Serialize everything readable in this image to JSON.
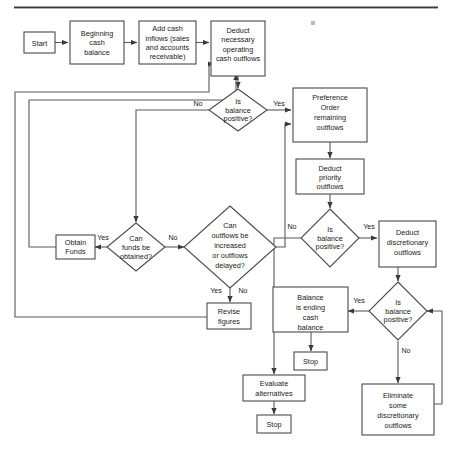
{
  "diagram": {
    "type": "flowchart",
    "colors": {
      "node_stroke": "#4a4a4a",
      "connector": "#5a5a5a",
      "text": "#1a1a1a",
      "background": "#ffffff"
    },
    "nodes": [
      {
        "id": "start",
        "shape": "rect",
        "label": "Start"
      },
      {
        "id": "beginning",
        "shape": "rect",
        "label": "Beginning cash balance"
      },
      {
        "id": "addcash",
        "shape": "rect",
        "label": "Add cash inflows (sales and accounts receivable)"
      },
      {
        "id": "deduct_nec",
        "shape": "rect",
        "label": "Deduct necessary operating cash outflows"
      },
      {
        "id": "bal1",
        "shape": "diamond",
        "label": "Is balance positive?"
      },
      {
        "id": "preference",
        "shape": "rect",
        "label": "Preference Order remaining outflows"
      },
      {
        "id": "deduct_pri",
        "shape": "rect",
        "label": "Deduct priority outflows"
      },
      {
        "id": "bal2",
        "shape": "diamond",
        "label": "Is balance positive?"
      },
      {
        "id": "deduct_disc",
        "shape": "rect",
        "label": "Deduct discretionary outflows"
      },
      {
        "id": "bal3",
        "shape": "diamond",
        "label": "Is balance positive?"
      },
      {
        "id": "canfunds",
        "shape": "diamond",
        "label": "Can funds be obtained?"
      },
      {
        "id": "obtain",
        "shape": "rect",
        "label": "Obtain Funds"
      },
      {
        "id": "canoutflows",
        "shape": "diamond",
        "label": "Can outflows be increased or outflows delayed?"
      },
      {
        "id": "revise",
        "shape": "rect",
        "label": "Revise figures"
      },
      {
        "id": "balending",
        "shape": "rect",
        "label": "Balance is ending cash balance"
      },
      {
        "id": "stop_bal",
        "shape": "rect",
        "label": "Stop"
      },
      {
        "id": "evaluate",
        "shape": "rect",
        "label": "Evaluate alternatives"
      },
      {
        "id": "stop_eval",
        "shape": "rect",
        "label": "Stop"
      },
      {
        "id": "eliminate",
        "shape": "rect",
        "label": "Eliminate some discretionary outflows"
      }
    ],
    "edge_labels": {
      "bal1_no": "No",
      "bal1_yes": "Yes",
      "bal2_no": "No",
      "bal2_yes": "Yes",
      "bal3_no": "No",
      "bal3_yes": "Yes",
      "canfunds_yes": "Yes",
      "canfunds_no": "No",
      "canoutflows_yes": "Yes",
      "canoutflows_no": "No"
    }
  }
}
